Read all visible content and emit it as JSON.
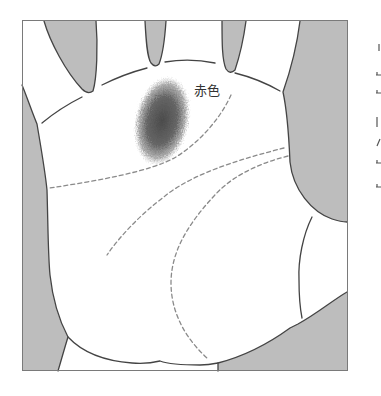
{
  "figure": {
    "kind": "palm illustration",
    "annotation_label": "赤色"
  },
  "colors": {
    "background": "#ffffff",
    "outline": "#444444",
    "gap_fill": "#bdbdbd",
    "dashed_line": "#8a8a8a",
    "mark_center": "#4a4a4a",
    "mark_edge": "#9a9a9a",
    "frame": "#7a7a7a",
    "label_text": "#333333"
  }
}
